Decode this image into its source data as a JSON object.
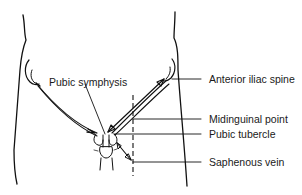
{
  "diagram": {
    "type": "anatomical-line-drawing",
    "labels": {
      "pubic_symphysis": "Pubic symphysis",
      "anterior_iliac_spine": "Anterior iliac spine",
      "midinguinal_point": "Midinguinal point",
      "pubic_tubercle": "Pubic tubercle",
      "saphenous_vein": "Saphenous vein"
    },
    "colors": {
      "ink": "#111111",
      "background": "#ffffff"
    }
  }
}
